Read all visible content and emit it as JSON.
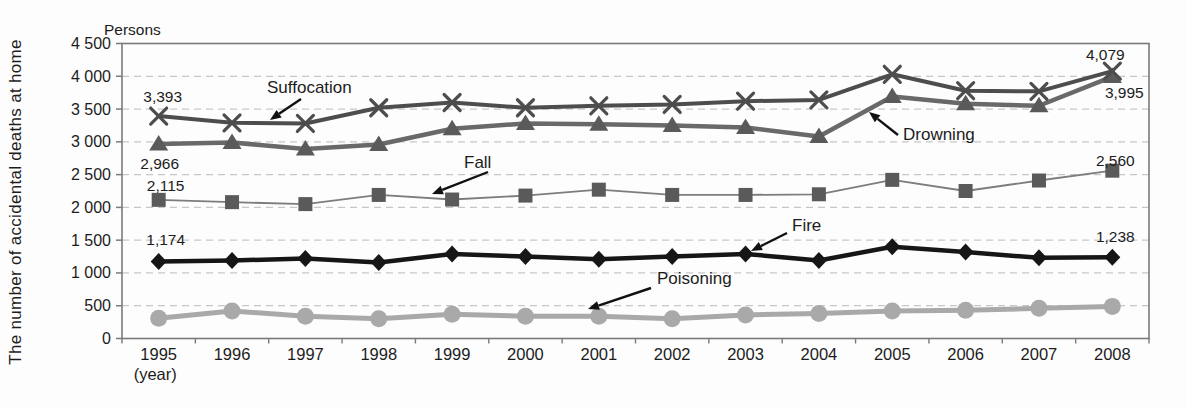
{
  "colors": {
    "background": "#fdfdfd",
    "grid": "#c7c7c7",
    "axis": "#7a7a7a",
    "text": "#1c1c1c",
    "annotation_arrow": "#111111"
  },
  "chart_data": {
    "type": "line",
    "unit_label": "Persons",
    "xlabel": "(year)",
    "ylabel": "The number of accidental deaths at home",
    "ylim": [
      0,
      4500
    ],
    "ytick_step": 500,
    "ytick_labels": [
      "0",
      "500",
      "1 000",
      "1 500",
      "2 000",
      "2 500",
      "3 000",
      "3 500",
      "4 000",
      "4 500"
    ],
    "grid": "horizontal dashed every 500, solid plot border",
    "legend_position": "inline annotations with arrows",
    "categories": [
      "1995",
      "1996",
      "1997",
      "1998",
      "1999",
      "2000",
      "2001",
      "2002",
      "2003",
      "2004",
      "2005",
      "2006",
      "2007",
      "2008"
    ],
    "series": [
      {
        "name": "Suffocation",
        "marker": "x",
        "color": "#4d4d4d",
        "line_width": 4,
        "values": [
          3393,
          3290,
          3280,
          3520,
          3600,
          3520,
          3550,
          3570,
          3620,
          3640,
          4030,
          3780,
          3770,
          4079
        ]
      },
      {
        "name": "Drowning",
        "marker": "triangle",
        "color": "#696969",
        "marker_color": "#5a5a5a",
        "line_width": 4.5,
        "values": [
          2966,
          2990,
          2890,
          2960,
          3200,
          3280,
          3270,
          3250,
          3220,
          3080,
          3690,
          3580,
          3550,
          3995
        ]
      },
      {
        "name": "Fall",
        "marker": "square",
        "color": "#7d7d7d",
        "marker_color": "#5a5a5a",
        "line_width": 1.8,
        "values": [
          2115,
          2080,
          2050,
          2190,
          2120,
          2180,
          2270,
          2190,
          2190,
          2200,
          2420,
          2250,
          2410,
          2560
        ]
      },
      {
        "name": "Fire",
        "marker": "diamond",
        "color": "#161616",
        "line_width": 4.5,
        "values": [
          1174,
          1190,
          1220,
          1160,
          1290,
          1250,
          1210,
          1250,
          1290,
          1190,
          1400,
          1320,
          1230,
          1238
        ]
      },
      {
        "name": "Poisoning",
        "marker": "circle",
        "color": "#a9a9a9",
        "line_width": 5,
        "values": [
          310,
          420,
          340,
          300,
          370,
          340,
          340,
          300,
          360,
          380,
          420,
          430,
          460,
          490
        ]
      }
    ],
    "point_labels": [
      {
        "text": "3,393",
        "series": 0,
        "year_index": 0,
        "dx": 4,
        "dy": -14
      },
      {
        "text": "2,966",
        "series": 1,
        "year_index": 0,
        "dx": 1,
        "dy": 25
      },
      {
        "text": "2,115",
        "series": 2,
        "year_index": 0,
        "dx": 7,
        "dy": -9
      },
      {
        "text": "1,174",
        "series": 3,
        "year_index": 0,
        "dx": 7,
        "dy": -17
      },
      {
        "text": "4,079",
        "series": 0,
        "year_index": 13,
        "dx": -7,
        "dy": -11
      },
      {
        "text": "3,995",
        "series": 1,
        "year_index": 13,
        "dx": 12,
        "dy": 21
      },
      {
        "text": "2,560",
        "series": 2,
        "year_index": 13,
        "dx": 3,
        "dy": -5
      },
      {
        "text": "1,238",
        "series": 3,
        "year_index": 13,
        "dx": 3,
        "dy": -15
      }
    ],
    "annotations": [
      {
        "text": "Suffocation",
        "x": 267,
        "y": 93,
        "arrow": {
          "x1": 301,
          "y1": 99,
          "x2": 270,
          "y2": 120
        }
      },
      {
        "text": "Fall",
        "x": 464,
        "y": 168,
        "arrow": {
          "x1": 488,
          "y1": 172,
          "x2": 432,
          "y2": 194
        }
      },
      {
        "text": "Drowning",
        "x": 903,
        "y": 140,
        "arrow": {
          "x1": 898,
          "y1": 135,
          "x2": 869,
          "y2": 112
        }
      },
      {
        "text": "Fire",
        "x": 792,
        "y": 231,
        "arrow": {
          "x1": 787,
          "y1": 233,
          "x2": 751,
          "y2": 251
        }
      },
      {
        "text": "Poisoning",
        "x": 657,
        "y": 284,
        "arrow": {
          "x1": 651,
          "y1": 288,
          "x2": 588,
          "y2": 309
        }
      }
    ]
  }
}
